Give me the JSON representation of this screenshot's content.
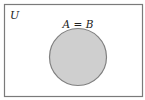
{
  "diagram": {
    "type": "venn",
    "universe_label": "U",
    "set_label": "A = B",
    "sets": [
      "A",
      "B"
    ],
    "relation": "A equals B (identical circles)",
    "colors": {
      "background": "#ffffff",
      "frame": "#7a7a7a",
      "set_fill": "#cfcfcf",
      "set_stroke": "#808080",
      "text": "#222222"
    }
  }
}
